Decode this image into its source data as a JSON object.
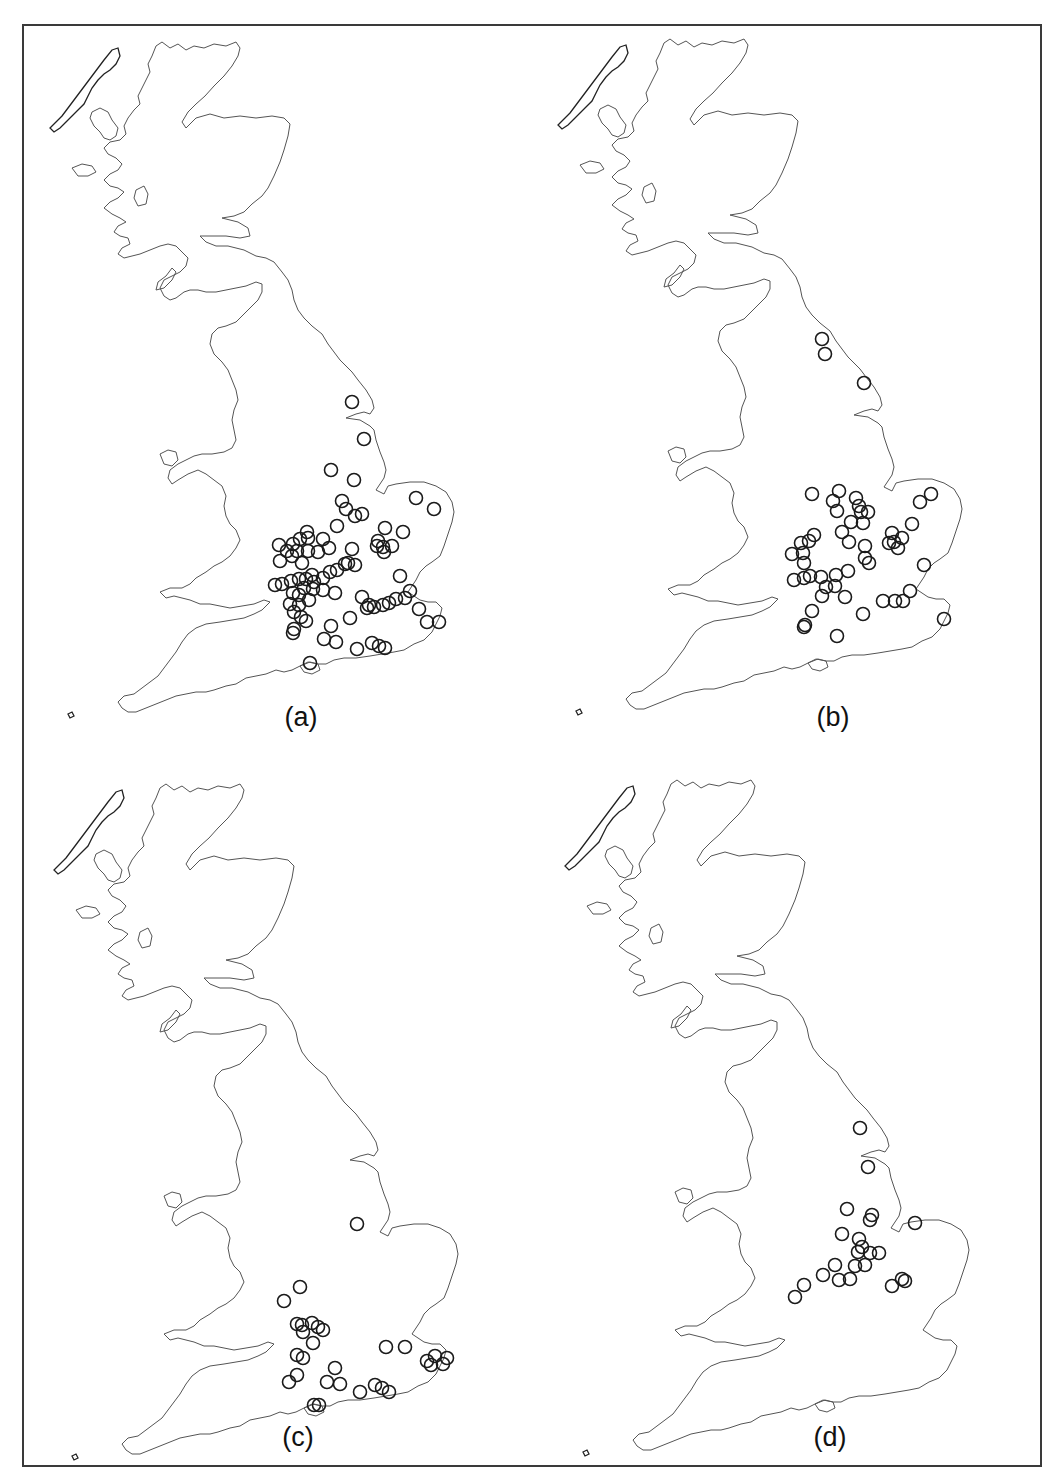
{
  "figure": {
    "frame_color": "#3a3a3a",
    "dot_style": "open circle",
    "panels": [
      {
        "id": "a",
        "label": "(a)",
        "offset": [
          0,
          0
        ],
        "label_pos": [
          301,
          704
        ],
        "points": [
          [
            352,
            402
          ],
          [
            364,
            439
          ],
          [
            331,
            470
          ],
          [
            354,
            480
          ],
          [
            342,
            501
          ],
          [
            346,
            509
          ],
          [
            355,
            516
          ],
          [
            362,
            514
          ],
          [
            416,
            498
          ],
          [
            434,
            509
          ],
          [
            337,
            526
          ],
          [
            385,
            528
          ],
          [
            403,
            532
          ],
          [
            378,
            541
          ],
          [
            377,
            546
          ],
          [
            383,
            547
          ],
          [
            392,
            546
          ],
          [
            384,
            552
          ],
          [
            352,
            549
          ],
          [
            307,
            532
          ],
          [
            300,
            539
          ],
          [
            308,
            538
          ],
          [
            293,
            544
          ],
          [
            279,
            545
          ],
          [
            287,
            551
          ],
          [
            297,
            551
          ],
          [
            308,
            551
          ],
          [
            318,
            552
          ],
          [
            323,
            539
          ],
          [
            329,
            548
          ],
          [
            280,
            561
          ],
          [
            292,
            556
          ],
          [
            302,
            563
          ],
          [
            345,
            564
          ],
          [
            355,
            565
          ],
          [
            348,
            563
          ],
          [
            337,
            570
          ],
          [
            330,
            572
          ],
          [
            323,
            578
          ],
          [
            312,
            575
          ],
          [
            306,
            579
          ],
          [
            299,
            579
          ],
          [
            291,
            581
          ],
          [
            275,
            585
          ],
          [
            282,
            584
          ],
          [
            314,
            582
          ],
          [
            304,
            588
          ],
          [
            313,
            589
          ],
          [
            323,
            590
          ],
          [
            335,
            593
          ],
          [
            293,
            593
          ],
          [
            299,
            595
          ],
          [
            309,
            600
          ],
          [
            290,
            604
          ],
          [
            299,
            605
          ],
          [
            294,
            612
          ],
          [
            301,
            617
          ],
          [
            306,
            621
          ],
          [
            294,
            629
          ],
          [
            293,
            633
          ],
          [
            331,
            626
          ],
          [
            350,
            618
          ],
          [
            324,
            639
          ],
          [
            336,
            642
          ],
          [
            310,
            663
          ],
          [
            357,
            649
          ],
          [
            372,
            643
          ],
          [
            379,
            646
          ],
          [
            385,
            648
          ],
          [
            362,
            597
          ],
          [
            369,
            605
          ],
          [
            367,
            608
          ],
          [
            374,
            607
          ],
          [
            383,
            605
          ],
          [
            389,
            603
          ],
          [
            396,
            599
          ],
          [
            405,
            598
          ],
          [
            410,
            591
          ],
          [
            400,
            576
          ],
          [
            419,
            609
          ],
          [
            427,
            622
          ],
          [
            439,
            622
          ]
        ]
      },
      {
        "id": "b",
        "label": "(b)",
        "offset": [
          508,
          -3
        ],
        "label_pos": [
          833,
          704
        ],
        "points": [
          [
            822,
            339
          ],
          [
            825,
            354
          ],
          [
            864,
            383
          ],
          [
            812,
            494
          ],
          [
            839,
            491
          ],
          [
            833,
            501
          ],
          [
            837,
            511
          ],
          [
            856,
            498
          ],
          [
            859,
            506
          ],
          [
            868,
            512
          ],
          [
            861,
            512
          ],
          [
            851,
            522
          ],
          [
            863,
            523
          ],
          [
            920,
            502
          ],
          [
            931,
            494
          ],
          [
            912,
            524
          ],
          [
            842,
            532
          ],
          [
            849,
            542
          ],
          [
            814,
            535
          ],
          [
            809,
            541
          ],
          [
            801,
            543
          ],
          [
            792,
            554
          ],
          [
            803,
            553
          ],
          [
            804,
            563
          ],
          [
            810,
            576
          ],
          [
            794,
            580
          ],
          [
            804,
            578
          ],
          [
            821,
            577
          ],
          [
            826,
            587
          ],
          [
            822,
            596
          ],
          [
            835,
            586
          ],
          [
            836,
            575
          ],
          [
            848,
            571
          ],
          [
            845,
            597
          ],
          [
            865,
            546
          ],
          [
            865,
            558
          ],
          [
            869,
            563
          ],
          [
            892,
            533
          ],
          [
            902,
            538
          ],
          [
            894,
            542
          ],
          [
            898,
            548
          ],
          [
            889,
            543
          ],
          [
            924,
            565
          ],
          [
            910,
            591
          ],
          [
            883,
            601
          ],
          [
            895,
            601
          ],
          [
            903,
            601
          ],
          [
            812,
            611
          ],
          [
            863,
            614
          ],
          [
            805,
            625
          ],
          [
            804,
            627
          ],
          [
            837,
            636
          ],
          [
            944,
            619
          ]
        ]
      },
      {
        "id": "c",
        "label": "(c)",
        "offset": [
          4,
          742
        ],
        "label_pos": [
          298,
          1424
        ],
        "points": [
          [
            357,
            1224
          ],
          [
            300,
            1287
          ],
          [
            284,
            1301
          ],
          [
            297,
            1324
          ],
          [
            302,
            1325
          ],
          [
            312,
            1323
          ],
          [
            318,
            1327
          ],
          [
            323,
            1330
          ],
          [
            303,
            1332
          ],
          [
            313,
            1343
          ],
          [
            297,
            1355
          ],
          [
            303,
            1358
          ],
          [
            335,
            1368
          ],
          [
            297,
            1375
          ],
          [
            289,
            1382
          ],
          [
            386,
            1347
          ],
          [
            405,
            1347
          ],
          [
            427,
            1361
          ],
          [
            435,
            1356
          ],
          [
            447,
            1358
          ],
          [
            443,
            1364
          ],
          [
            431,
            1365
          ],
          [
            327,
            1382
          ],
          [
            340,
            1384
          ],
          [
            360,
            1392
          ],
          [
            375,
            1385
          ],
          [
            382,
            1388
          ],
          [
            389,
            1392
          ],
          [
            314,
            1405
          ],
          [
            319,
            1405
          ]
        ]
      },
      {
        "id": "d",
        "label": "(d)",
        "offset": [
          515,
          738
        ],
        "label_pos": [
          830,
          1424
        ],
        "points": [
          [
            860,
            1128
          ],
          [
            868,
            1167
          ],
          [
            847,
            1209
          ],
          [
            872,
            1215
          ],
          [
            870,
            1220
          ],
          [
            915,
            1223
          ],
          [
            842,
            1234
          ],
          [
            859,
            1239
          ],
          [
            862,
            1247
          ],
          [
            858,
            1252
          ],
          [
            870,
            1253
          ],
          [
            879,
            1253
          ],
          [
            865,
            1265
          ],
          [
            855,
            1266
          ],
          [
            835,
            1265
          ],
          [
            823,
            1275
          ],
          [
            839,
            1280
          ],
          [
            850,
            1279
          ],
          [
            804,
            1285
          ],
          [
            795,
            1297
          ],
          [
            892,
            1286
          ],
          [
            902,
            1279
          ],
          [
            905,
            1281
          ]
        ]
      }
    ]
  }
}
